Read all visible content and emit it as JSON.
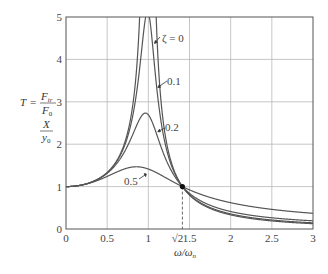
{
  "chart_data": {
    "type": "line",
    "title": "",
    "xlabel": "ω/ω_n",
    "ylabel_lines": [
      "T = F_tr / F_0",
      "X / y_0"
    ],
    "xlim": [
      0,
      3
    ],
    "ylim": [
      0,
      5
    ],
    "grid": true,
    "x_ticks": [
      {
        "value": 0,
        "label": "0"
      },
      {
        "value": 0.5,
        "label": "0.5"
      },
      {
        "value": 1,
        "label": "1"
      },
      {
        "value": 1.414,
        "label": "√2"
      },
      {
        "value": 1.5,
        "label": "1.5"
      },
      {
        "value": 2,
        "label": "2"
      },
      {
        "value": 2.5,
        "label": "2.5"
      },
      {
        "value": 3,
        "label": "3"
      }
    ],
    "y_ticks": [
      {
        "value": 0,
        "label": "0"
      },
      {
        "value": 1,
        "label": "1"
      },
      {
        "value": 2,
        "label": "2"
      },
      {
        "value": 3,
        "label": "3"
      },
      {
        "value": 4,
        "label": "4"
      },
      {
        "value": 5,
        "label": "5"
      }
    ],
    "formula": "T = sqrt((1 + (2ζr)^2) / ((1 - r^2)^2 + (2ζr)^2))",
    "series": [
      {
        "name": "ζ = 0",
        "zeta": 0,
        "label": "ζ = 0",
        "x": [
          0,
          0.5,
          0.8,
          0.9,
          0.95,
          1.0,
          1.05,
          1.1,
          1.2,
          1.414,
          1.5,
          2,
          2.5,
          3
        ],
        "values": [
          1.0,
          1.33,
          2.78,
          5.26,
          10.3,
          null,
          9.76,
          4.76,
          2.27,
          1.0,
          0.8,
          0.33,
          0.19,
          0.125
        ]
      },
      {
        "name": "0.1",
        "zeta": 0.1,
        "label": "0.1",
        "x": [
          0,
          0.5,
          0.8,
          0.9,
          1.0,
          1.1,
          1.2,
          1.414,
          1.5,
          2,
          2.5,
          3
        ],
        "values": [
          1.0,
          1.33,
          2.7,
          4.4,
          5.1,
          3.9,
          2.2,
          1.0,
          0.82,
          0.37,
          0.24,
          0.18
        ]
      },
      {
        "name": "0.2",
        "zeta": 0.2,
        "label": "0.2",
        "x": [
          0,
          0.5,
          0.8,
          0.9,
          1.0,
          1.1,
          1.2,
          1.414,
          1.5,
          2,
          2.5,
          3
        ],
        "values": [
          1.0,
          1.32,
          2.45,
          2.94,
          2.69,
          2.25,
          1.79,
          1.0,
          0.86,
          0.44,
          0.31,
          0.25
        ]
      },
      {
        "name": "0.5",
        "zeta": 0.5,
        "label": "0.5",
        "x": [
          0,
          0.5,
          0.8,
          0.9,
          1.0,
          1.1,
          1.2,
          1.414,
          1.5,
          2,
          2.5,
          3
        ],
        "values": [
          1.0,
          1.26,
          1.44,
          1.45,
          1.41,
          1.33,
          1.24,
          1.0,
          0.93,
          0.63,
          0.5,
          0.43
        ]
      }
    ],
    "annotations": [
      {
        "text": "ζ = 0",
        "points_to_zeta": 0
      },
      {
        "text": "0.1",
        "points_to_zeta": 0.1
      },
      {
        "text": "0.2",
        "points_to_zeta": 0.2
      },
      {
        "text": "0.5",
        "points_to_zeta": 0.5
      },
      {
        "text": "crossover point",
        "x": 1.414,
        "y": 1,
        "marker": "dot",
        "dashed_drop_to_axis": true
      }
    ]
  },
  "labels": {
    "y_line1_T": "T",
    "y_line1_eq": "=",
    "y_line1_num": "F",
    "y_line1_num_sub": "tr",
    "y_line1_den": "F",
    "y_line1_den_sub": "0",
    "y_line2_num": "X",
    "y_line2_den": "y",
    "y_line2_den_sub": "0",
    "x_label_main": "ω/ω",
    "x_label_sub": "n",
    "ann_z0": "ζ = 0",
    "ann_z01": "0.1",
    "ann_z02": "0.2",
    "ann_z05": "0.5"
  }
}
